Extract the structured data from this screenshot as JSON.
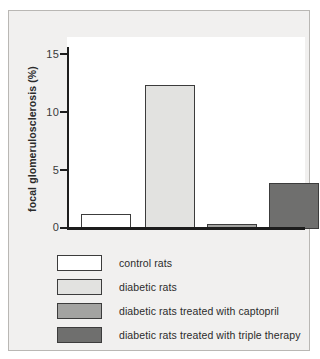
{
  "chart_data": {
    "type": "bar",
    "title": "",
    "xlabel": "",
    "ylabel": "focal glomerulosclerosis (%)",
    "ylim": [
      0,
      15
    ],
    "yticks": [
      "0",
      "5",
      "10",
      "15"
    ],
    "ytick_values": [
      0,
      5,
      10,
      15
    ],
    "grid": false,
    "legend_position": "below-plot",
    "categories": [
      "control rats",
      "diabetic rats",
      "diabetic rats treated with captopril",
      "diabetic rats treated with triple therapy"
    ],
    "values": [
      1.3,
      12.4,
      0.4,
      4.0
    ],
    "colors": [
      "#ffffff",
      "#e2e2e0",
      "#a3a3a1",
      "#6f6f6e"
    ],
    "bar_edge_color": "#3c3c3c"
  },
  "legend": {
    "items": [
      {
        "label": "control rats",
        "color": "#ffffff"
      },
      {
        "label": "diabetic rats",
        "color": "#e2e2e0"
      },
      {
        "label": "diabetic rats treated with captopril",
        "color": "#a3a3a1"
      },
      {
        "label": "diabetic rats treated with triple therapy",
        "color": "#6f6f6e"
      }
    ]
  },
  "axis": {
    "tick_15": "15",
    "tick_10": "10",
    "tick_5": "5",
    "tick_0": "0",
    "y_label": "focal glomerulosclerosis (%)"
  }
}
